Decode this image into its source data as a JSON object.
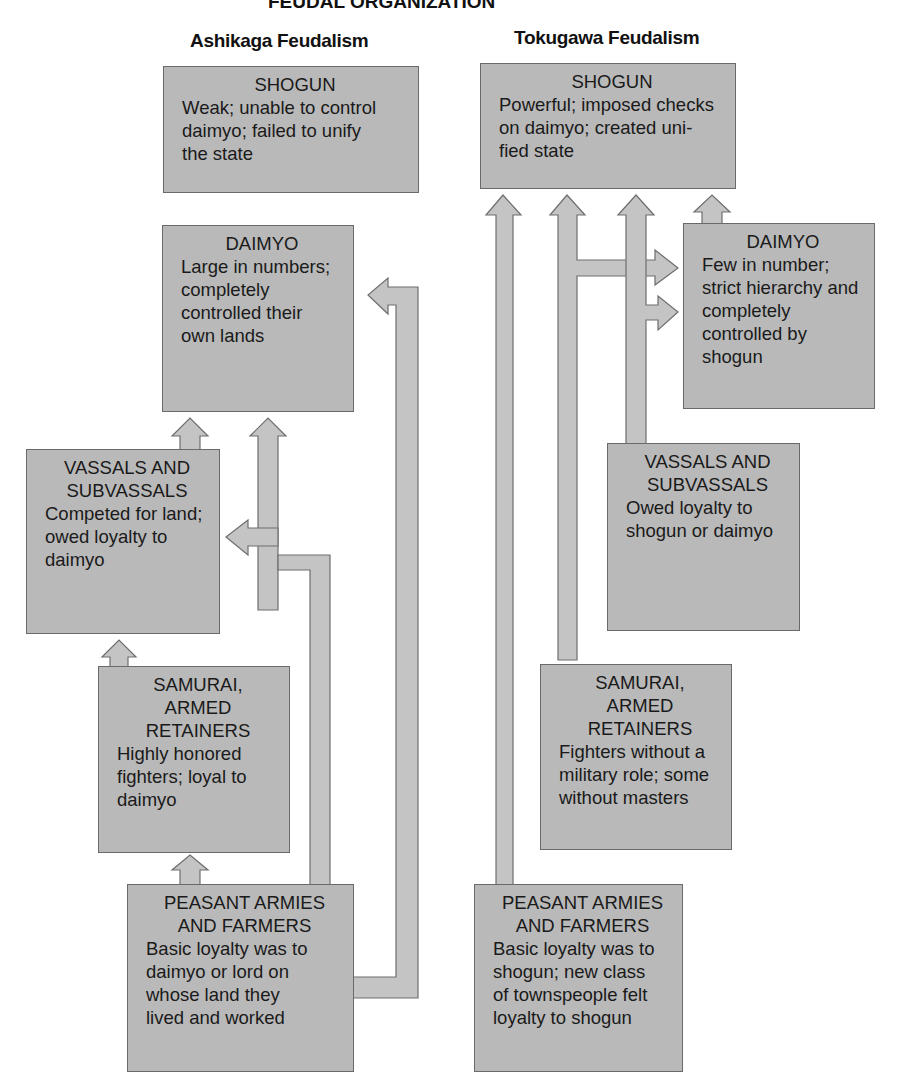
{
  "title_fragment": "FEUDAL ORGANIZATION",
  "columns": {
    "ashikaga": {
      "title": "Ashikaga Feudalism",
      "boxes": {
        "shogun": {
          "head": "SHOGUN",
          "lines": [
            "Weak; unable to control",
            "daimyo; failed to unify",
            "the state"
          ]
        },
        "daimyo": {
          "head": "DAIMYO",
          "lines": [
            "Large in numbers;",
            "completely",
            "controlled their",
            "own lands"
          ]
        },
        "vassals": {
          "head": [
            "VASSALS AND",
            "SUBVASSALS"
          ],
          "lines": [
            "Competed for land;",
            "owed loyalty to",
            "daimyo"
          ]
        },
        "samurai": {
          "head": [
            "SAMURAI,",
            "ARMED",
            "RETAINERS"
          ],
          "lines": [
            "Highly honored",
            "fighters; loyal to",
            "daimyo"
          ]
        },
        "peasants": {
          "head": [
            "PEASANT ARMIES",
            "AND FARMERS"
          ],
          "lines": [
            "Basic loyalty was to",
            "daimyo or lord on",
            "whose land they",
            "lived and worked"
          ]
        }
      }
    },
    "tokugawa": {
      "title": "Tokugawa Feudalism",
      "boxes": {
        "shogun": {
          "head": "SHOGUN",
          "lines": [
            "Powerful; imposed checks",
            "on daimyo; created uni-",
            "fied state"
          ]
        },
        "daimyo": {
          "head": "DAIMYO",
          "lines": [
            "Few in number;",
            "strict hierarchy and",
            "completely",
            "controlled by",
            "shogun"
          ]
        },
        "vassals": {
          "head": [
            "VASSALS AND",
            "SUBVASSALS"
          ],
          "lines": [
            "Owed loyalty to",
            "shogun or daimyo"
          ]
        },
        "samurai": {
          "head": [
            "SAMURAI,",
            "ARMED",
            "RETAINERS"
          ],
          "lines": [
            "Fighters without a",
            "military role; some",
            "without masters"
          ]
        },
        "peasants": {
          "head": [
            "PEASANT ARMIES",
            "AND FARMERS"
          ],
          "lines": [
            "Basic loyalty was to",
            "shogun; new class",
            "of townspeople felt",
            "loyalty to shogun"
          ]
        }
      }
    }
  },
  "colors": {
    "box_fill": "#b9b9b9",
    "arrow_fill": "#c4c4c4",
    "outline": "#6a6a6a"
  }
}
